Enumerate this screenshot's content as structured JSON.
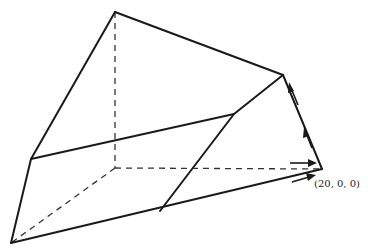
{
  "diagram": {
    "type": "3d-polyhedron-wireframe",
    "vertices": {
      "top": [
        115,
        12
      ],
      "top_right": [
        283,
        75
      ],
      "left_mid": [
        31,
        159
      ],
      "bottom_left": [
        11,
        243
      ],
      "hidden_origin": [
        115,
        168
      ],
      "right_bottom": [
        322,
        169
      ],
      "mid_right": [
        234,
        114
      ],
      "bottom_mid": [
        160,
        211
      ]
    },
    "labels": {
      "point_label": "(20, 0, 0)"
    },
    "colors": {
      "line": "#1a1a1a",
      "background": "#ffffff"
    }
  }
}
